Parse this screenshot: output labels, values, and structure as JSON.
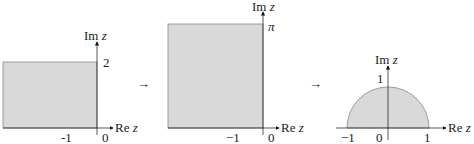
{
  "colors": {
    "fill": "#d9d9d9",
    "edge": "#8a8a8a",
    "axis": "#111111",
    "text": "#222222"
  },
  "panels": [
    {
      "id": "rectangle-height-2",
      "shape": "rectangle",
      "axes": {
        "re_label_prefix": "Re",
        "im_label_prefix": "Im",
        "variable": "z"
      },
      "ticks": {
        "x": [
          "-1",
          "0"
        ],
        "y": [
          "2"
        ]
      },
      "region": "Re z < 0, 0 < Im z < 2"
    },
    {
      "id": "rectangle-height-pi",
      "shape": "rectangle",
      "axes": {
        "re_label_prefix": "Re",
        "im_label_prefix": "Im",
        "variable": "z"
      },
      "ticks": {
        "x": [
          "−1",
          "0"
        ],
        "y": [
          "π"
        ]
      },
      "region": "Re z < 0, 0 < Im z < π"
    },
    {
      "id": "upper-half-disk",
      "shape": "semicircle",
      "axes": {
        "re_label_prefix": "Re",
        "im_label_prefix": "Im",
        "variable": "z"
      },
      "ticks": {
        "x": [
          "−1",
          "0",
          "1"
        ],
        "y": [
          "1"
        ]
      },
      "region": "|z| < 1, Im z > 0"
    }
  ],
  "arrows": [
    "→",
    "→"
  ]
}
